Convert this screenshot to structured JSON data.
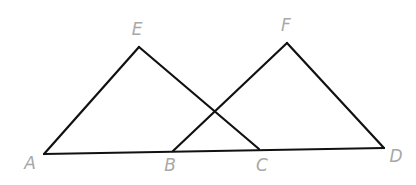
{
  "diagram": {
    "type": "geometry",
    "colors": {
      "line": "#111111",
      "label": "#a8a8a8",
      "background": "#ffffff"
    },
    "points": {
      "A": {
        "label": "A",
        "x": 44,
        "y": 154
      },
      "B": {
        "label": "B",
        "x": 173,
        "y": 151
      },
      "C": {
        "label": "C",
        "x": 259,
        "y": 149
      },
      "D": {
        "label": "D",
        "x": 384,
        "y": 148
      },
      "E": {
        "label": "E",
        "x": 139,
        "y": 47
      },
      "F": {
        "label": "F",
        "x": 287,
        "y": 43
      }
    },
    "segments": [
      {
        "from": "A",
        "to": "D"
      },
      {
        "from": "A",
        "to": "E"
      },
      {
        "from": "E",
        "to": "C"
      },
      {
        "from": "B",
        "to": "F"
      },
      {
        "from": "F",
        "to": "D"
      }
    ],
    "triangles": [
      "AEC",
      "BFD"
    ]
  }
}
